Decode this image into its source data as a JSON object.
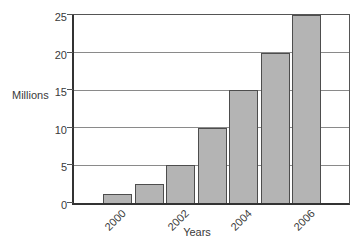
{
  "chart_data": {
    "type": "bar",
    "title": "",
    "xlabel": "Years",
    "ylabel": "Millions",
    "categories": [
      "2000",
      "2001",
      "2002",
      "2003",
      "2004",
      "2005",
      "2006"
    ],
    "values": [
      1.25,
      2.5,
      5,
      10,
      15,
      20,
      25
    ],
    "ylim": [
      0,
      25
    ],
    "yticks": [
      0,
      5,
      10,
      15,
      20,
      25
    ],
    "ytick_labels": [
      "0",
      "5",
      "10",
      "15",
      "20",
      "25"
    ],
    "xtick_labels": [
      "2000",
      "2002",
      "2004",
      "2006"
    ],
    "xtick_bar_indices": [
      0,
      2,
      4,
      6
    ],
    "grid": "horizontal",
    "legend": "none",
    "colors": {
      "bar_fill": "#b4b4b4",
      "bar_border": "#4d4d4d",
      "frame": "#444444",
      "gridline": "#8a8a8a",
      "text": "#3a3a3a",
      "background": "#ffffff"
    }
  }
}
